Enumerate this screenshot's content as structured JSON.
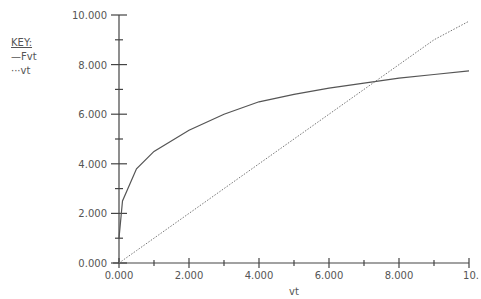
{
  "key": {
    "title": "KEY:",
    "entries": [
      {
        "label": "—Fvt",
        "style": "solid"
      },
      {
        "label": "···vt",
        "style": "dotted"
      }
    ]
  },
  "chart_data": {
    "type": "line",
    "title": "",
    "xlabel": "vt",
    "ylabel": "",
    "xlim": [
      0,
      10
    ],
    "ylim": [
      0,
      10
    ],
    "x_ticks": [
      "0.000",
      "2.000",
      "4.000",
      "6.000",
      "8.000",
      "10."
    ],
    "y_ticks": [
      "0.000",
      "2.000",
      "4.000",
      "6.000",
      "8.000",
      "10.000"
    ],
    "grid": false,
    "legend_position": "upper-left (outside plot)",
    "x": [
      0,
      0.1,
      0.5,
      1,
      2,
      3,
      4,
      5,
      6,
      7,
      8,
      9,
      10
    ],
    "series": [
      {
        "name": "Fvt",
        "style": "solid",
        "values": [
          1.0,
          2.5,
          3.8,
          4.5,
          5.35,
          6.0,
          6.5,
          6.8,
          7.05,
          7.25,
          7.45,
          7.6,
          7.75
        ]
      },
      {
        "name": "vt",
        "style": "dotted",
        "values": [
          0,
          0.1,
          0.5,
          1,
          2,
          3,
          4,
          5,
          6,
          7,
          8,
          9,
          9.75
        ]
      }
    ]
  }
}
